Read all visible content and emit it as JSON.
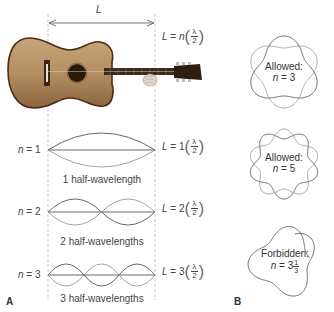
{
  "panel_a": {
    "letter": "A",
    "length_label": "L",
    "general_eq": {
      "lhs": "L",
      "coef": "n",
      "num": "λ",
      "den": "2"
    },
    "modes": [
      {
        "n_label": "n",
        "n_value": "1",
        "eq_coef": "1",
        "caption": "1 half-wavelength"
      },
      {
        "n_label": "n",
        "n_value": "2",
        "eq_coef": "2",
        "caption": "2 half-wavelengths"
      },
      {
        "n_label": "n",
        "n_value": "3",
        "eq_coef": "3",
        "caption": "3 half-wavelengths"
      }
    ]
  },
  "panel_b": {
    "letter": "B",
    "circles": [
      {
        "status": "Allowed:",
        "n_label": "n",
        "n_value": "3"
      },
      {
        "status": "Allowed:",
        "n_label": "n",
        "n_value": "5"
      },
      {
        "status": "Forbidden:",
        "n_label": "n",
        "n_whole": "3",
        "n_num": "1",
        "n_den": "3"
      }
    ]
  },
  "colors": {
    "line": "#555555",
    "wave_light": "#999999",
    "guide": "#bbbbbb",
    "guitar_body": "#b8956a",
    "guitar_edge": "#5a3a1e",
    "guitar_neck": "#3a2a1a"
  }
}
